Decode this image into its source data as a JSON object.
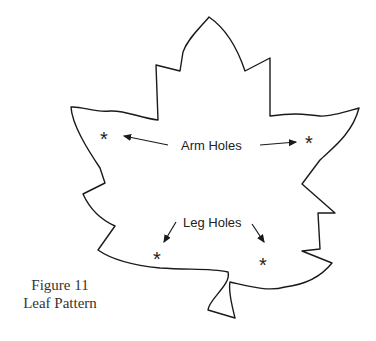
{
  "figure": {
    "labels": {
      "arm_holes": "Arm Holes",
      "leg_holes": "Leg Holes"
    },
    "marker_glyph": "*",
    "caption": {
      "line1": "Figure 11",
      "line2": "Leaf Pattern"
    },
    "colors": {
      "outline": "#1a1a1a",
      "background": "#ffffff"
    }
  }
}
